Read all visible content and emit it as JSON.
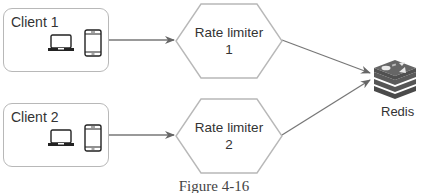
{
  "clients": [
    {
      "label": "Client 1",
      "devices": [
        "laptop-icon",
        "phone-icon"
      ]
    },
    {
      "label": "Client 2",
      "devices": [
        "laptop-icon",
        "phone-icon"
      ]
    }
  ],
  "rate_limiters": [
    {
      "line1": "Rate limiter",
      "line2": "1"
    },
    {
      "line1": "Rate limiter",
      "line2": "2"
    }
  ],
  "store": {
    "label": "Redis",
    "icon": "redis-icon"
  },
  "caption": "Figure 4-16",
  "colors": {
    "stroke": "#b8b8b8",
    "arrow": "#666666",
    "redis_dark": "#555555"
  }
}
